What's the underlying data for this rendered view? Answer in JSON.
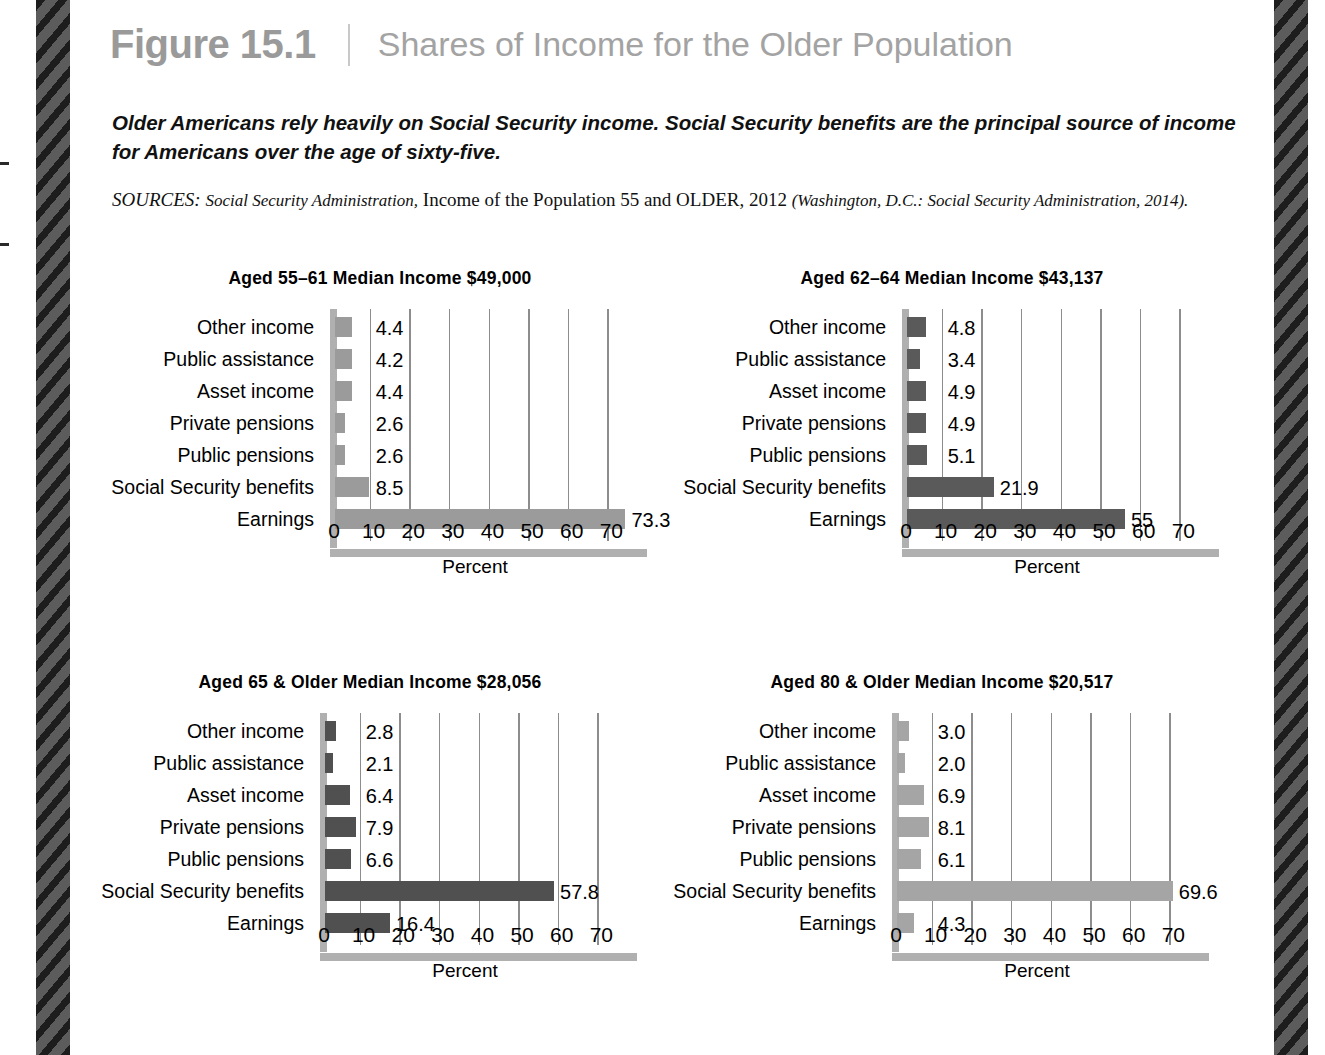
{
  "header": {
    "figure_number": "Figure 15.1",
    "divider": "|",
    "title": "Shares of Income for the Older Population"
  },
  "caption": "Older Americans rely heavily on Social Security income. Social Security benefits are the principal source of income for Americans over the age of sixty-five.",
  "sources": {
    "label": "SOURCES:",
    "agency": "Social Security Administration,",
    "work": "Income of the Population 55 and OLDER, 2012",
    "publication": "(Washington, D.C.: Social Security Administration, 2014)."
  },
  "colors": {
    "figure_number": "#9a9a9a",
    "figure_title": "#a3a3a3",
    "bar_light": "#9b9b9b",
    "bar_dark": "#5a5a5a",
    "bar_darker": "#505050",
    "bar_lightest": "#a5a5a5",
    "axis": "#b0b0b0",
    "gridline": "#8d8d8d",
    "stripe_dark": "#1d1d1d",
    "stripe_light": "#5c5c5c"
  },
  "chart_data": [
    {
      "id": "aged-55-61",
      "type": "bar",
      "orientation": "horizontal",
      "title": "Aged 55–61 Median Income $49,000",
      "xlabel": "Percent",
      "ylabel": "",
      "xlim": [
        0,
        80
      ],
      "xticks": [
        0,
        10,
        20,
        30,
        40,
        50,
        60,
        70
      ],
      "grid": true,
      "bar_color": "#9b9b9b",
      "categories": [
        "Other income",
        "Public assistance",
        "Asset income",
        "Private pensions",
        "Public pensions",
        "Social Security benefits",
        "Earnings"
      ],
      "values": [
        4.4,
        4.2,
        4.4,
        2.6,
        2.6,
        8.5,
        73.3
      ],
      "value_labels": [
        "4.4",
        "4.2",
        "4.4",
        "2.6",
        "2.6",
        "8.5",
        "73.3"
      ]
    },
    {
      "id": "aged-62-64",
      "type": "bar",
      "orientation": "horizontal",
      "title": "Aged 62–64 Median Income $43,137",
      "xlabel": "Percent",
      "ylabel": "",
      "xlim": [
        0,
        80
      ],
      "xticks": [
        0,
        10,
        20,
        30,
        40,
        50,
        60,
        70
      ],
      "grid": true,
      "bar_color": "#5a5a5a",
      "categories": [
        "Other income",
        "Public assistance",
        "Asset income",
        "Private pensions",
        "Public pensions",
        "Social Security benefits",
        "Earnings"
      ],
      "values": [
        4.8,
        3.4,
        4.9,
        4.9,
        5.1,
        21.9,
        55.0
      ],
      "value_labels": [
        "4.8",
        "3.4",
        "4.9",
        "4.9",
        "5.1",
        "21.9",
        "55"
      ]
    },
    {
      "id": "aged-65-older",
      "type": "bar",
      "orientation": "horizontal",
      "title": "Aged 65 & Older Median Income $28,056",
      "xlabel": "Percent",
      "ylabel": "",
      "xlim": [
        0,
        80
      ],
      "xticks": [
        0,
        10,
        20,
        30,
        40,
        50,
        60,
        70
      ],
      "grid": true,
      "bar_color": "#505050",
      "categories": [
        "Other income",
        "Public assistance",
        "Asset income",
        "Private pensions",
        "Public pensions",
        "Social Security benefits",
        "Earnings"
      ],
      "values": [
        2.8,
        2.1,
        6.4,
        7.9,
        6.6,
        57.8,
        16.4
      ],
      "value_labels": [
        "2.8",
        "2.1",
        "6.4",
        "7.9",
        "6.6",
        "57.8",
        "16.4"
      ]
    },
    {
      "id": "aged-80-older",
      "type": "bar",
      "orientation": "horizontal",
      "title": "Aged 80 & Older Median Income $20,517",
      "xlabel": "Percent",
      "ylabel": "",
      "xlim": [
        0,
        80
      ],
      "xticks": [
        0,
        10,
        20,
        30,
        40,
        50,
        60,
        70
      ],
      "grid": true,
      "bar_color": "#a5a5a5",
      "categories": [
        "Other income",
        "Public assistance",
        "Asset income",
        "Private pensions",
        "Public pensions",
        "Social Security benefits",
        "Earnings"
      ],
      "values": [
        3.0,
        2.0,
        6.9,
        8.1,
        6.1,
        69.6,
        4.3
      ],
      "value_labels": [
        "3.0",
        "2.0",
        "6.9",
        "8.1",
        "6.1",
        "69.6",
        "4.3"
      ]
    }
  ]
}
